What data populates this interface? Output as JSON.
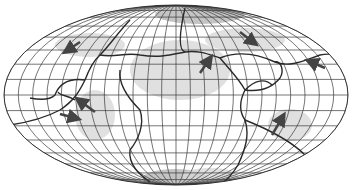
{
  "map": {
    "projection": "equal-area-ellipse",
    "width": 352,
    "height": 190,
    "center": [
      176,
      95
    ],
    "radii": [
      172,
      90
    ],
    "meridian_count": 24,
    "parallel_count": 18,
    "colors": {
      "background": "#ffffff",
      "grid": "#3a3a3a",
      "boundary": "#2a2a2a",
      "shading_light": "#d8d8d8",
      "shading_mid": "#b5b5b5",
      "shading_dark": "#909090",
      "arrow": "#444444"
    },
    "shaded_regions": [
      {
        "name": "north-polar-cap",
        "cx": 200,
        "cy": 14,
        "rx": 45,
        "ry": 10,
        "tone": "shading_mid"
      },
      {
        "name": "south-polar-cap",
        "cx": 175,
        "cy": 178,
        "rx": 32,
        "ry": 9,
        "tone": "shading_mid"
      },
      {
        "name": "south-polar-cap-2",
        "cx": 210,
        "cy": 176,
        "rx": 28,
        "ry": 8,
        "tone": "shading_light"
      },
      {
        "name": "upper-left-band",
        "cx": 90,
        "cy": 45,
        "rx": 35,
        "ry": 12,
        "tone": "shading_light"
      },
      {
        "name": "upper-right-band",
        "cx": 245,
        "cy": 40,
        "rx": 40,
        "ry": 12,
        "tone": "shading_light"
      },
      {
        "name": "center-plate",
        "cx": 180,
        "cy": 70,
        "rx": 50,
        "ry": 30,
        "tone": "shading_light"
      },
      {
        "name": "right-lower",
        "cx": 290,
        "cy": 125,
        "rx": 22,
        "ry": 16,
        "tone": "shading_light"
      },
      {
        "name": "left-mid",
        "cx": 95,
        "cy": 115,
        "rx": 20,
        "ry": 25,
        "tone": "shading_light"
      }
    ],
    "arrows": [
      {
        "name": "arrow-upper-left",
        "x1": 80,
        "y1": 42,
        "x2": 68,
        "y2": 50
      },
      {
        "name": "arrow-upper-right",
        "x1": 240,
        "y1": 32,
        "x2": 253,
        "y2": 42
      },
      {
        "name": "arrow-center-right",
        "x1": 200,
        "y1": 73,
        "x2": 209,
        "y2": 60
      },
      {
        "name": "arrow-far-right",
        "x1": 325,
        "y1": 68,
        "x2": 311,
        "y2": 62
      },
      {
        "name": "arrow-left-mid",
        "x1": 95,
        "y1": 112,
        "x2": 80,
        "y2": 101
      },
      {
        "name": "arrow-left-lower",
        "x1": 60,
        "y1": 114,
        "x2": 75,
        "y2": 118
      },
      {
        "name": "arrow-lower-right",
        "x1": 272,
        "y1": 135,
        "x2": 282,
        "y2": 118
      }
    ],
    "boundaries": [
      "M 130 20 C 120 30, 110 45, 100 55 C 92 62, 88 72, 85 80 C 80 90, 75 100, 60 110 C 45 118, 30 122, 10 125",
      "M 100 55 C 115 58, 125 52, 140 55 C 160 58, 170 55, 185 52 C 200 50, 210 55, 220 58",
      "M 120 70 C 118 85, 130 100, 140 110 C 145 125, 138 140, 130 150 C 128 165, 140 175, 150 182",
      "M 185 8 C 180 30, 178 50, 185 52",
      "M 220 58 C 230 70, 240 80, 245 90 C 240 100, 238 110, 245 120 C 250 135, 245 150, 238 165 C 232 175, 225 182, 218 186",
      "M 220 58 C 240 50, 260 55, 275 62 C 290 68, 305 60, 320 55 C 335 52, 345 58, 350 62",
      "M 245 90 C 260 92, 272 88, 280 78 C 285 70, 280 60, 275 62",
      "M 245 120 C 270 130, 290 140, 305 155 C 315 162, 325 158, 340 150",
      "M 85 80 C 70 78, 60 82, 55 95 C 50 100, 40 100, 30 98",
      "M 75 100 C 68 95, 60 96, 58 92",
      "M 245 90 C 255 80, 265 78, 272 85"
    ]
  }
}
